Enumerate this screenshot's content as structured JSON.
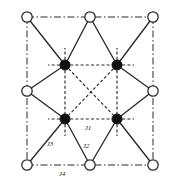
{
  "figure": {
    "width": 178,
    "height": 183,
    "background": "#ffffff"
  },
  "colors": {
    "line": "#2b2b2b",
    "open_node_fill": "#ffffff",
    "open_node_stroke": "#2b2b2b",
    "filled_node_fill": "#111111",
    "filled_node_stroke": "#111111",
    "label_text": "#1a1a1a"
  },
  "geometry": {
    "cell": {
      "left": 27,
      "top": 17,
      "right": 153,
      "bottom": 165,
      "mid_x": 90,
      "mid_y": 91
    },
    "node_radius_open": 5.2,
    "node_radius_filled": 5.0
  },
  "nodes": {
    "open": [
      {
        "id": "open-top-left",
        "label": "A site corner top-left",
        "cx": 27,
        "cy": 17
      },
      {
        "id": "open-top-mid",
        "label": "A site edge top-middle",
        "cx": 90,
        "cy": 17
      },
      {
        "id": "open-top-right",
        "label": "A site corner top-right",
        "cx": 153,
        "cy": 17
      },
      {
        "id": "open-mid-left",
        "label": "A site edge middle-left",
        "cx": 27,
        "cy": 91
      },
      {
        "id": "open-mid-right",
        "label": "A site edge middle-right",
        "cx": 153,
        "cy": 91
      },
      {
        "id": "open-bottom-left",
        "label": "A site corner bottom-left",
        "cx": 27,
        "cy": 165
      },
      {
        "id": "open-bottom-mid",
        "label": "A site edge bottom-middle",
        "cx": 90,
        "cy": 165
      },
      {
        "id": "open-bottom-right",
        "label": "A site corner bottom-right",
        "cx": 153,
        "cy": 165
      }
    ],
    "filled": [
      {
        "id": "filled-top-left",
        "label": "B site interior top-left",
        "cx": 65,
        "cy": 65
      },
      {
        "id": "filled-top-right",
        "label": "B site interior top-right",
        "cx": 117,
        "cy": 65
      },
      {
        "id": "filled-bottom-left",
        "label": "B site interior bottom-left",
        "cx": 65,
        "cy": 119
      },
      {
        "id": "filled-bottom-right",
        "label": "B site interior bottom-right",
        "cx": 117,
        "cy": 119
      }
    ]
  },
  "edges": {
    "cell_boundary": {
      "style": "dash-dot",
      "description": "unit cell outline through open circles",
      "segments": [
        {
          "id": "boundary-top",
          "x1": 27,
          "y1": 17,
          "x2": 153,
          "y2": 17
        },
        {
          "id": "boundary-right",
          "x1": 153,
          "y1": 17,
          "x2": 153,
          "y2": 165
        },
        {
          "id": "boundary-bottom",
          "x1": 27,
          "y1": 165,
          "x2": 153,
          "y2": 165
        },
        {
          "id": "boundary-left",
          "x1": 27,
          "y1": 17,
          "x2": 27,
          "y2": 165
        }
      ]
    },
    "inner_dashed": {
      "style": "dashed",
      "description": "bonds between interior filled sites",
      "segments": [
        {
          "id": "inner-top",
          "x1": 65,
          "y1": 65,
          "x2": 117,
          "y2": 65
        },
        {
          "id": "inner-bottom",
          "x1": 65,
          "y1": 119,
          "x2": 117,
          "y2": 119
        },
        {
          "id": "inner-left",
          "x1": 65,
          "y1": 65,
          "x2": 65,
          "y2": 119
        },
        {
          "id": "inner-right",
          "x1": 117,
          "y1": 65,
          "x2": 117,
          "y2": 119
        },
        {
          "id": "inner-diag-a",
          "x1": 65,
          "y1": 65,
          "x2": 117,
          "y2": 119
        },
        {
          "id": "inner-diag-b",
          "x1": 117,
          "y1": 65,
          "x2": 65,
          "y2": 119
        }
      ]
    },
    "stub_dashed": {
      "style": "dashed",
      "description": "short dashed stubs radiating outward from filled sites",
      "segments": [
        {
          "id": "stub-tl-left",
          "x1": 65,
          "y1": 65,
          "x2": 48,
          "y2": 65
        },
        {
          "id": "stub-tl-up",
          "x1": 65,
          "y1": 65,
          "x2": 65,
          "y2": 48
        },
        {
          "id": "stub-tr-right",
          "x1": 117,
          "y1": 65,
          "x2": 134,
          "y2": 65
        },
        {
          "id": "stub-tr-up",
          "x1": 117,
          "y1": 65,
          "x2": 117,
          "y2": 48
        },
        {
          "id": "stub-bl-left",
          "x1": 65,
          "y1": 119,
          "x2": 48,
          "y2": 119
        },
        {
          "id": "stub-bl-down",
          "x1": 65,
          "y1": 119,
          "x2": 65,
          "y2": 136
        },
        {
          "id": "stub-br-right",
          "x1": 117,
          "y1": 119,
          "x2": 134,
          "y2": 119
        },
        {
          "id": "stub-br-down",
          "x1": 117,
          "y1": 119,
          "x2": 117,
          "y2": 136
        }
      ]
    },
    "solid": {
      "style": "solid",
      "description": "bonds connecting open boundary sites to interior filled sites",
      "segments": [
        {
          "id": "solid-otl-ftl",
          "x1": 27,
          "y1": 17,
          "x2": 65,
          "y2": 65
        },
        {
          "id": "solid-otm-ftl",
          "x1": 90,
          "y1": 17,
          "x2": 65,
          "y2": 65
        },
        {
          "id": "solid-otm-ftr",
          "x1": 90,
          "y1": 17,
          "x2": 117,
          "y2": 65
        },
        {
          "id": "solid-otr-ftr",
          "x1": 153,
          "y1": 17,
          "x2": 117,
          "y2": 65
        },
        {
          "id": "solid-oml-ftl",
          "x1": 27,
          "y1": 91,
          "x2": 65,
          "y2": 65
        },
        {
          "id": "solid-oml-fbl",
          "x1": 27,
          "y1": 91,
          "x2": 65,
          "y2": 119
        },
        {
          "id": "solid-omr-ftr",
          "x1": 153,
          "y1": 91,
          "x2": 117,
          "y2": 65
        },
        {
          "id": "solid-omr-fbr",
          "x1": 153,
          "y1": 91,
          "x2": 117,
          "y2": 119
        },
        {
          "id": "solid-obl-fbl",
          "x1": 27,
          "y1": 165,
          "x2": 65,
          "y2": 119
        },
        {
          "id": "solid-obm-fbl",
          "x1": 90,
          "y1": 165,
          "x2": 65,
          "y2": 119
        },
        {
          "id": "solid-obm-fbr",
          "x1": 90,
          "y1": 165,
          "x2": 117,
          "y2": 119
        },
        {
          "id": "solid-obr-fbr",
          "x1": 153,
          "y1": 165,
          "x2": 117,
          "y2": 119
        }
      ]
    }
  },
  "labels": [
    {
      "id": "label-j1",
      "text": "J1",
      "x": 88,
      "y": 130,
      "describes": "inner-bottom dashed bond between interior sites"
    },
    {
      "id": "label-j2",
      "text": "J2",
      "x": 86,
      "y": 148,
      "describes": "solid bond from bottom-middle open site to interior site"
    },
    {
      "id": "label-j3",
      "text": "J3",
      "x": 50,
      "y": 146,
      "describes": "solid bond from bottom-left open site to interior site"
    },
    {
      "id": "label-j4",
      "text": "J4",
      "x": 62,
      "y": 176,
      "describes": "dash-dot bond along bottom cell boundary"
    }
  ]
}
